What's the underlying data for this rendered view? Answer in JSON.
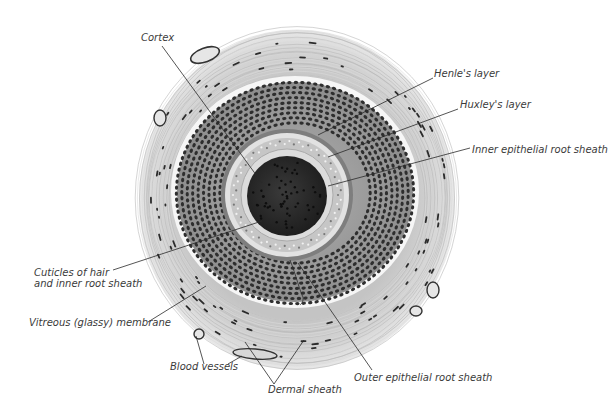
{
  "figure": {
    "labels": {
      "cortex": "Cortex",
      "henle": "Henle's layer",
      "huxley": "Huxley's layer",
      "inner_sheath": "Inner epithelial root sheath",
      "cuticles_line1": "Cuticles of hair",
      "cuticles_line2": "and inner root sheath",
      "vitreous": "Vitreous (glassy) membrane",
      "blood_vessels": "Blood vessels",
      "dermal_sheath": "Dermal sheath",
      "outer_sheath": "Outer epithelial root sheath"
    },
    "colors": {
      "background": "#ffffff",
      "dermal": "#cfcfcf",
      "dermal_light": "#e4e4e4",
      "vitreous": "#f4f4f4",
      "outer_sheath": "#9a9a9a",
      "nucleus": "#2b2b2b",
      "inner_sheath": "#d8d8d8",
      "cortex": "#303030",
      "label_text": "#3a3a3a"
    }
  }
}
